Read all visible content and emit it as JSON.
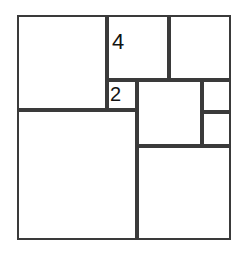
{
  "figure": {
    "type": "squared-square-dissection",
    "background_color": "#ffffff",
    "line_color": "#3a3a3a",
    "label_color": "#131313",
    "line_width": 2,
    "canvas": {
      "width": 239,
      "height": 257
    },
    "outer_square": {
      "x": 17,
      "y": 15,
      "width": 214,
      "height": 225
    },
    "labels": [
      {
        "name": "square-label-4",
        "text": "4",
        "x": 112,
        "y": 31,
        "font_size": 22
      },
      {
        "name": "square-label-2",
        "text": "2",
        "x": 110,
        "y": 84,
        "font_size": 20
      }
    ],
    "squares": [
      {
        "name": "square-top-left",
        "x": 17,
        "y": 15,
        "width": 90,
        "height": 95,
        "label": ""
      },
      {
        "name": "square-label-four",
        "x": 107,
        "y": 15,
        "width": 62,
        "height": 65,
        "label": "4"
      },
      {
        "name": "square-top-right",
        "x": 169,
        "y": 15,
        "width": 62,
        "height": 65,
        "label": ""
      },
      {
        "name": "square-label-two",
        "x": 107,
        "y": 80,
        "width": 30,
        "height": 30,
        "label": "2"
      },
      {
        "name": "square-middle",
        "x": 137,
        "y": 80,
        "width": 65,
        "height": 66,
        "label": ""
      },
      {
        "name": "square-right-upper",
        "x": 202,
        "y": 80,
        "width": 29,
        "height": 32,
        "label": ""
      },
      {
        "name": "square-right-lower",
        "x": 202,
        "y": 112,
        "width": 29,
        "height": 34,
        "label": ""
      },
      {
        "name": "square-bottom-left",
        "x": 17,
        "y": 110,
        "width": 120,
        "height": 130,
        "label": ""
      },
      {
        "name": "square-bottom-right",
        "x": 137,
        "y": 146,
        "width": 94,
        "height": 94,
        "label": ""
      }
    ]
  }
}
